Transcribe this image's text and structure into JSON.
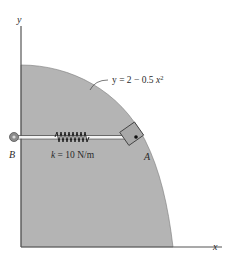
{
  "figure": {
    "axes": {
      "x_label": "x",
      "y_label": "y"
    },
    "curve": {
      "equation_lhs": "y = 2 − 0.5 ",
      "equation_var": "x",
      "equation_exp": "2"
    },
    "spring": {
      "label_k": "k",
      "label_value": " = 10 N/m"
    },
    "points": {
      "B": "B",
      "A": "A"
    },
    "colors": {
      "region_fill": "#b4b4b4",
      "axis": "#555555",
      "block_fill": "#a8a8a8"
    }
  }
}
